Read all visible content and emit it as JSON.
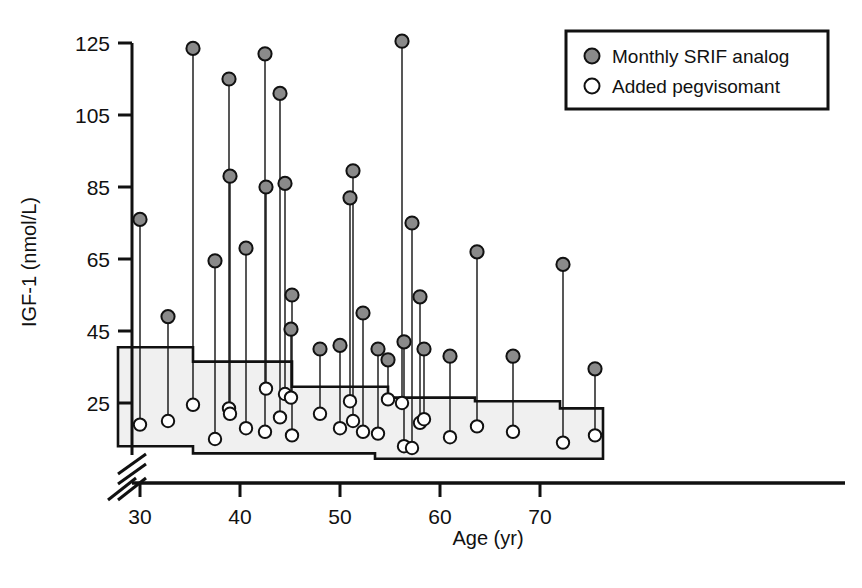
{
  "figure": {
    "background": "#ffffff",
    "ink": "#111111",
    "marker_filled_color": "#8a8a8a",
    "marker_open_color": "#ffffff",
    "band_fill_color": "#f0f0f0",
    "band_edge_color": "#111111"
  },
  "legend": {
    "position": "top-right",
    "border_color": "#111111",
    "entries": [
      {
        "marker": "filled-circle",
        "label": "Monthly SRIF analog"
      },
      {
        "marker": "open-circle",
        "label": "Added pegvisomant"
      }
    ]
  },
  "chart_data": {
    "type": "scatter",
    "title": "",
    "subtitle": "",
    "xlabel": "Age (yr)",
    "ylabel": "IGF-1 (nmol/L)",
    "xlim": [
      27.5,
      76.5
    ],
    "ylim": [
      8,
      130
    ],
    "xticks": [
      30,
      40,
      50,
      60,
      70
    ],
    "xtick_labels": [
      "30",
      "40",
      "50",
      "60",
      "70"
    ],
    "yticks": [
      25,
      45,
      65,
      85,
      105,
      125
    ],
    "ytick_labels": [
      "25",
      "45",
      "65",
      "85",
      "105",
      "125"
    ],
    "grid": false,
    "axis_break": {
      "axis": "both",
      "note": "double slash break near origin on x and y axes"
    },
    "legend_position": "top-right",
    "annotations": [],
    "series": [
      {
        "name": "Monthly SRIF analog",
        "marker": "filled-circle",
        "color": "#8a8a8a",
        "x": [
          30.0,
          32.8,
          35.3,
          37.5,
          38.9,
          39.0,
          40.6,
          42.5,
          42.6,
          44.0,
          44.5,
          45.1,
          45.2,
          48.0,
          50.0,
          51.0,
          51.3,
          52.3,
          53.8,
          54.8,
          56.2,
          56.4,
          57.2,
          58.0,
          58.4,
          61.0,
          63.7,
          67.3,
          72.3,
          75.5
        ],
        "y": [
          76.0,
          49.0,
          123.5,
          64.5,
          115.0,
          88.0,
          68.0,
          122.0,
          85.0,
          111.0,
          86.0,
          45.5,
          55.0,
          40.0,
          41.0,
          82.0,
          89.5,
          50.0,
          40.0,
          37.0,
          125.5,
          42.0,
          75.0,
          54.5,
          40.0,
          38.0,
          67.0,
          38.0,
          63.5,
          34.5
        ]
      },
      {
        "name": "Added pegvisomant",
        "marker": "open-circle",
        "color": "#ffffff",
        "x": [
          30.0,
          32.8,
          35.3,
          37.5,
          38.9,
          39.0,
          40.6,
          42.5,
          42.6,
          44.0,
          44.5,
          45.1,
          45.2,
          48.0,
          50.0,
          51.0,
          51.3,
          52.3,
          53.8,
          54.8,
          56.2,
          56.4,
          57.2,
          58.0,
          58.4,
          61.0,
          63.7,
          67.3,
          72.3,
          75.5
        ],
        "y": [
          19.0,
          20.0,
          24.5,
          15.0,
          23.5,
          22.0,
          18.0,
          17.0,
          29.0,
          21.0,
          27.5,
          26.5,
          16.0,
          22.0,
          18.0,
          25.5,
          20.0,
          17.0,
          16.5,
          26.0,
          25.0,
          13.0,
          12.5,
          19.5,
          20.5,
          15.5,
          18.5,
          17.0,
          14.0,
          16.0
        ]
      }
    ],
    "pairs_note": "Each filled point is connected by a thin vertical line to the open point at the same age.",
    "reference_band": {
      "name": "Age-adjusted normal range",
      "fill": "#f0f0f0",
      "upper_steps": [
        {
          "x_start": 27.8,
          "x_end": 35.3,
          "value": 40.5
        },
        {
          "x_start": 35.3,
          "x_end": 45.2,
          "value": 36.5
        },
        {
          "x_start": 45.2,
          "x_end": 54.8,
          "value": 29.5
        },
        {
          "x_start": 54.8,
          "x_end": 63.5,
          "value": 26.5
        },
        {
          "x_start": 63.5,
          "x_end": 72.0,
          "value": 25.5
        },
        {
          "x_start": 72.0,
          "x_end": 76.3,
          "value": 23.5
        }
      ],
      "lower_steps": [
        {
          "x_start": 27.8,
          "x_end": 35.3,
          "value": 13.0
        },
        {
          "x_start": 35.3,
          "x_end": 53.5,
          "value": 11.0
        },
        {
          "x_start": 53.5,
          "x_end": 76.3,
          "value": 9.5
        }
      ]
    }
  }
}
